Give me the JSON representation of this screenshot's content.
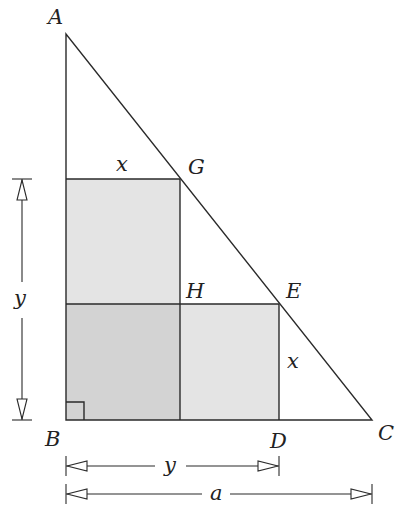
{
  "diagram": {
    "type": "geometry",
    "points": {
      "A": {
        "label": "A",
        "x": 66,
        "y": 34
      },
      "B": {
        "label": "B",
        "x": 66,
        "y": 420
      },
      "C": {
        "label": "C",
        "x": 372,
        "y": 420
      },
      "D": {
        "label": "D",
        "x": 279,
        "y": 420
      },
      "E": {
        "label": "E",
        "x": 279,
        "y": 304
      },
      "G": {
        "label": "G",
        "x": 180,
        "y": 179
      },
      "H": {
        "label": "H",
        "x": 180,
        "y": 304
      }
    },
    "segment_labels": {
      "top_of_upper_square": "x",
      "right_of_lower_square": "x"
    },
    "dimensions": {
      "vertical": {
        "label": "y"
      },
      "horizontal_short": {
        "label": "y"
      },
      "horizontal_long": {
        "label": "a"
      }
    },
    "right_angle_marker": "B",
    "colors": {
      "light_fill": "#e4e4e4",
      "overlap_fill": "#d3d3d3",
      "line": "#2a2a2a",
      "background": "#ffffff"
    }
  }
}
